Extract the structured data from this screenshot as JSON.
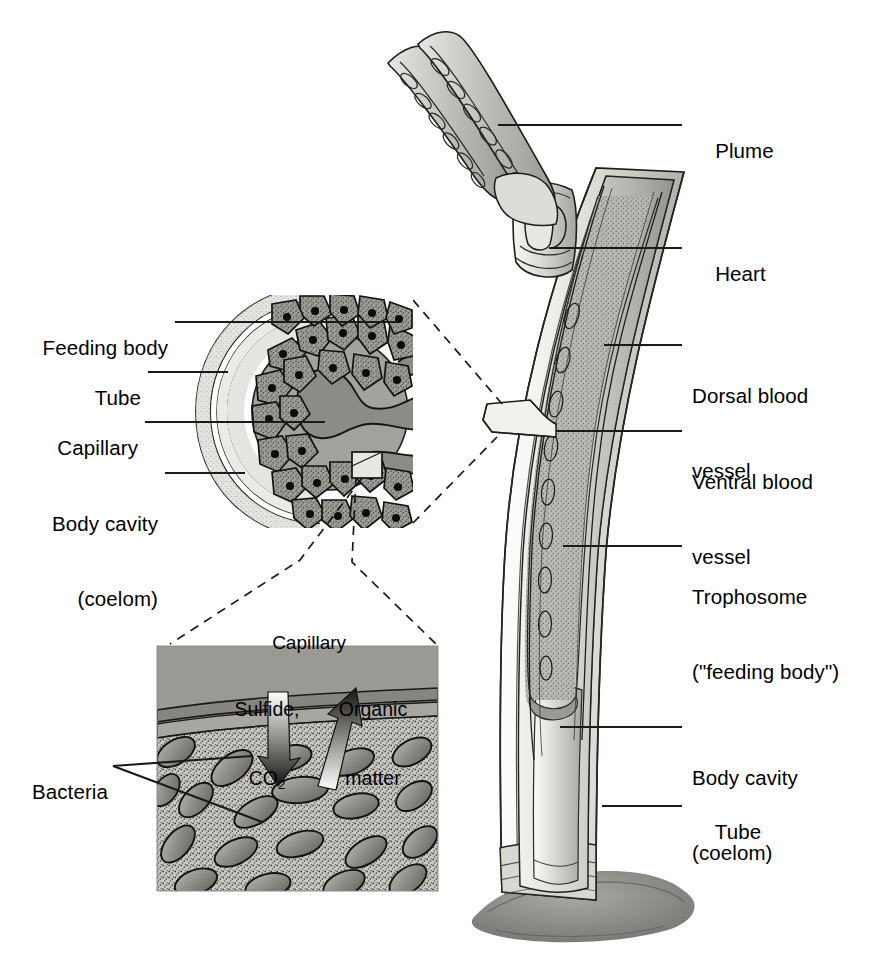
{
  "figure": {
    "background": "#ffffff",
    "ink": "#000000"
  },
  "main_labels": [
    {
      "id": "plume",
      "text": "Plume",
      "text2": ""
    },
    {
      "id": "heart",
      "text": "Heart",
      "text2": ""
    },
    {
      "id": "dorsal",
      "text": "Dorsal blood",
      "text2": "vessel"
    },
    {
      "id": "ventral",
      "text": "Ventral blood",
      "text2": "vessel"
    },
    {
      "id": "tropho",
      "text": "Trophosome",
      "text2": "(\"feeding body\")"
    },
    {
      "id": "coelom",
      "text": "Body cavity",
      "text2": "(coelom)"
    },
    {
      "id": "tube",
      "text": "Tube",
      "text2": ""
    }
  ],
  "cross_section_labels": [
    {
      "id": "feeding-body",
      "text": "Feeding body",
      "text2": ""
    },
    {
      "id": "tube",
      "text": "Tube",
      "text2": ""
    },
    {
      "id": "capillary",
      "text": "Capillary",
      "text2": ""
    },
    {
      "id": "body-cavity",
      "text": "Body cavity",
      "text2": "(coelom)"
    }
  ],
  "inset": {
    "title": "Capillary",
    "flux_in_line1": "Sulfide,",
    "flux_in_line2": "CO",
    "flux_in_sub": "2",
    "flux_out_line1": "Organic",
    "flux_out_line2": "matter",
    "bacteria_label": "Bacteria"
  },
  "palette": {
    "tube_fill": "#e2e0dc",
    "coelom_fill": "#cfcdc8",
    "trophosome_fill": "#b7b5b0",
    "cell_fill": "#9a9892",
    "capillary_fill": "#8d8b86",
    "capillary_lumen": "#8a8883",
    "bacteria_fill": "#8f8d88",
    "matrix_fill": "#c9c7c1",
    "sediment": "#8c8a85",
    "line": "#1a1a1a"
  }
}
